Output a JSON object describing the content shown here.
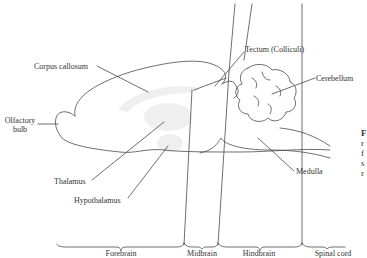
{
  "figure": {
    "labels": {
      "corpus_callosum": "Corpus callosum",
      "olfactory_bulb_line1": "Olfactory",
      "olfactory_bulb_line2": "bulb",
      "thalamus": "Thalamus",
      "hypothalamus": "Hypothalamus",
      "tectum": "Tectum (Colliculi)",
      "cerebellum": "Cerebellum",
      "medulla": "Medulla"
    },
    "regions": [
      {
        "label": "Forebrain"
      },
      {
        "label": "Midbrain"
      },
      {
        "label": "Hindbrain"
      },
      {
        "label": "Spinal cord"
      }
    ],
    "caption_fragment": [
      "F",
      "r",
      "f",
      "s",
      "r"
    ],
    "colors": {
      "line": "#4a4a4a",
      "shading": "#eeeeee",
      "text": "#333333"
    }
  }
}
